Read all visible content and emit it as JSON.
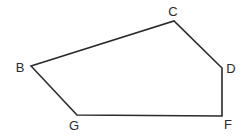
{
  "diagram": {
    "type": "polygon",
    "shape": "pentagon",
    "stroke_color": "#2a2a2a",
    "vertices": [
      {
        "name": "B",
        "x": 31,
        "y": 66,
        "label_x": 20,
        "label_y": 72
      },
      {
        "name": "C",
        "x": 174,
        "y": 21,
        "label_x": 173,
        "label_y": 16
      },
      {
        "name": "D",
        "x": 222,
        "y": 68,
        "label_x": 231,
        "label_y": 73
      },
      {
        "name": "F",
        "x": 222,
        "y": 116,
        "label_x": 228,
        "label_y": 129
      },
      {
        "name": "G",
        "x": 77,
        "y": 115,
        "label_x": 74,
        "label_y": 130
      }
    ],
    "labels": {
      "B": "B",
      "C": "C",
      "D": "D",
      "F": "F",
      "G": "G"
    }
  }
}
